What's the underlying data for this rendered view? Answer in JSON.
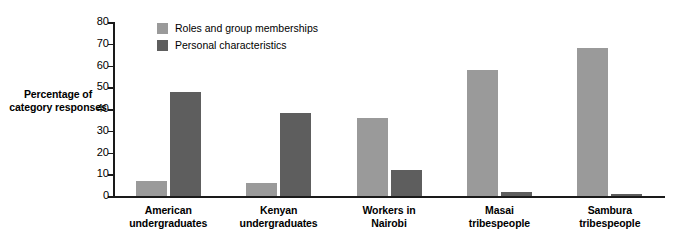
{
  "chart_data": {
    "type": "bar",
    "title": "",
    "xlabel": "",
    "ylabel": "Percentage of category responses",
    "ylim": [
      0,
      80
    ],
    "ytick_step": 10,
    "yticks": [
      0,
      10,
      20,
      30,
      40,
      50,
      60,
      70,
      80
    ],
    "grid": false,
    "legend_position": "top-left-inside",
    "categories": [
      "American undergraduates",
      "Kenyan undergraduates",
      "Workers in Nairobi",
      "Masai tribespeople",
      "Sambura tribespeople"
    ],
    "category_lines": [
      [
        "American",
        "undergraduates"
      ],
      [
        "Kenyan",
        "undergraduates"
      ],
      [
        "Workers in",
        "Nairobi"
      ],
      [
        "Masai",
        "tribespeople"
      ],
      [
        "Sambura",
        "tribespeople"
      ]
    ],
    "series": [
      {
        "name": "Roles and group memberships",
        "color": "#9a9a9a",
        "values": [
          7,
          6,
          36,
          58,
          68
        ]
      },
      {
        "name": "Personal characteristics",
        "color": "#5e5e5e",
        "values": [
          48,
          38,
          12,
          2,
          1
        ]
      }
    ]
  },
  "axis": {
    "y_title_line1": "Percentage of",
    "y_title_line2": "category responses"
  },
  "colors": {
    "series_light": "#9a9a9a",
    "series_dark": "#5e5e5e",
    "axis": "#1a1a1a",
    "background": "#ffffff"
  }
}
